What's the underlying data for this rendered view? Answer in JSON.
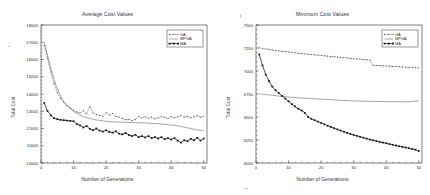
{
  "figure": {
    "background_color": "#ffffff",
    "axis_color": "#000000",
    "text_color": "#2b2b2b"
  },
  "chart_data": [
    {
      "type": "line",
      "title": "Average Cost Values",
      "xlabel": "Number of Generations",
      "ylabel": "Total Cost",
      "xlim": [
        0,
        51
      ],
      "ylim": [
        10000,
        18000
      ],
      "xticks": [
        0,
        10,
        20,
        30,
        40,
        50
      ],
      "yticks": [
        10000,
        11000,
        12000,
        13000,
        14000,
        15000,
        16000,
        17000,
        18000
      ],
      "xtick_labels": [
        "0",
        "10",
        "20",
        "30",
        "40",
        "50"
      ],
      "ytick_labels": [
        "10000",
        "11000",
        "12000",
        "13000",
        "14000",
        "15000",
        "16000",
        "17000",
        "18000"
      ],
      "grid": false,
      "legend_position": "upper right",
      "x": [
        1,
        2,
        3,
        4,
        5,
        6,
        7,
        8,
        9,
        10,
        11,
        12,
        13,
        14,
        15,
        16,
        17,
        18,
        19,
        20,
        21,
        22,
        23,
        24,
        25,
        26,
        27,
        28,
        29,
        30,
        31,
        32,
        33,
        34,
        35,
        36,
        37,
        38,
        39,
        40,
        41,
        42,
        43,
        44,
        45,
        46,
        47,
        48,
        49,
        50
      ],
      "series": [
        {
          "name": "GA",
          "style": "dashed-marker",
          "color": "#2a2a2a",
          "values": [
            16820,
            16080,
            15280,
            14620,
            14060,
            13760,
            13520,
            13320,
            13200,
            13060,
            12960,
            12900,
            13020,
            12840,
            13280,
            12900,
            12800,
            12760,
            12700,
            12940,
            12780,
            12860,
            12700,
            12660,
            12580,
            12500,
            12540,
            12460,
            12520,
            12700,
            12620,
            12680,
            12600,
            12660,
            12560,
            12620,
            12700,
            12640,
            12580,
            12700,
            12620,
            12680,
            12740,
            12660,
            12700,
            12620,
            12680,
            12740,
            12660,
            12700
          ]
        },
        {
          "name": "MPGA",
          "style": "solid-thin",
          "color": "#5a5a5a",
          "values": [
            17000,
            16250,
            15500,
            14850,
            14300,
            13900,
            13560,
            13320,
            13160,
            13000,
            12880,
            12780,
            12700,
            12640,
            12580,
            12540,
            12500,
            12470,
            12440,
            12420,
            12400,
            12390,
            12380,
            12370,
            12360,
            12350,
            12345,
            12340,
            12335,
            12330,
            12325,
            12320,
            12310,
            12300,
            12290,
            12280,
            12260,
            12240,
            12220,
            12200,
            12180,
            12150,
            12120,
            12080,
            12040,
            12000,
            11960,
            11920,
            11890,
            11870
          ]
        },
        {
          "name": "MA",
          "style": "thick-dotted",
          "color": "#111111",
          "values": [
            13480,
            13020,
            12760,
            12600,
            12540,
            12500,
            12480,
            12460,
            12440,
            12420,
            12260,
            12180,
            12060,
            12140,
            11980,
            11900,
            12000,
            11880,
            11820,
            11900,
            11800,
            11760,
            11840,
            11700,
            11660,
            11740,
            11620,
            11560,
            11640,
            11500,
            11560,
            11480,
            11560,
            11440,
            11500,
            11420,
            11500,
            11380,
            11440,
            11360,
            11440,
            11300,
            11180,
            11320,
            11260,
            11400,
            11320,
            11460,
            11300,
            11420
          ]
        }
      ],
      "legend": [
        {
          "label": "GA",
          "style": "dashed-marker"
        },
        {
          "label": "MPGA",
          "style": "solid-thin"
        },
        {
          "label": "MA",
          "style": "thick-dotted"
        }
      ]
    },
    {
      "type": "line",
      "title": "Minimum Cost Values",
      "xlabel": "Number of Generations",
      "ylabel": "Total Cost",
      "xlim": [
        0,
        51
      ],
      "ylim": [
        6000,
        7500
      ],
      "xticks": [
        0,
        10,
        20,
        30,
        40,
        50
      ],
      "yticks": [
        6000,
        6250,
        6500,
        6750,
        7000,
        7250,
        7500
      ],
      "xtick_labels": [
        "0",
        "10",
        "20",
        "30",
        "40",
        "50"
      ],
      "ytick_labels": [
        "6000",
        "6250",
        "6500",
        "6750",
        "7000",
        "7250",
        "7500"
      ],
      "grid": false,
      "legend_position": "upper right",
      "x": [
        1,
        2,
        3,
        4,
        5,
        6,
        7,
        8,
        9,
        10,
        11,
        12,
        13,
        14,
        15,
        16,
        17,
        18,
        19,
        20,
        21,
        22,
        23,
        24,
        25,
        26,
        27,
        28,
        29,
        30,
        31,
        32,
        33,
        34,
        35,
        36,
        37,
        38,
        39,
        40,
        41,
        42,
        43,
        44,
        45,
        46,
        47,
        48,
        49,
        50
      ],
      "series": [
        {
          "name": "GA",
          "style": "dashed-marker",
          "color": "#2a2a2a",
          "values": [
            7252,
            7246,
            7240,
            7234,
            7228,
            7222,
            7218,
            7214,
            7210,
            7206,
            7202,
            7198,
            7194,
            7190,
            7186,
            7182,
            7178,
            7176,
            7172,
            7168,
            7165,
            7162,
            7158,
            7155,
            7152,
            7148,
            7145,
            7142,
            7138,
            7135,
            7132,
            7128,
            7125,
            7122,
            7118,
            7062,
            7060,
            7058,
            7056,
            7054,
            7052,
            7050,
            7048,
            7046,
            7044,
            7042,
            7040,
            7038,
            7036,
            7034
          ]
        },
        {
          "name": "MPGA",
          "style": "solid-thin",
          "color": "#5a5a5a",
          "values": [
            6752,
            6748,
            6744,
            6740,
            6736,
            6732,
            6728,
            6724,
            6720,
            6717,
            6714,
            6711,
            6708,
            6706,
            6704,
            6702,
            6700,
            6698,
            6696,
            6694,
            6692,
            6690,
            6688,
            6686,
            6684,
            6682,
            6680,
            6678,
            6676,
            6675,
            6674,
            6673,
            6672,
            6671,
            6670,
            6669,
            6669,
            6668,
            6668,
            6667,
            6667,
            6666,
            6666,
            6666,
            6665,
            6665,
            6665,
            6670,
            6672,
            6674
          ]
        },
        {
          "name": "MA",
          "style": "thick-dotted",
          "color": "#111111",
          "values": [
            7180,
            7060,
            6960,
            6890,
            6830,
            6790,
            6760,
            6730,
            6700,
            6670,
            6640,
            6615,
            6590,
            6570,
            6545,
            6500,
            6480,
            6465,
            6450,
            6435,
            6420,
            6405,
            6392,
            6378,
            6365,
            6352,
            6340,
            6328,
            6316,
            6305,
            6295,
            6285,
            6275,
            6265,
            6255,
            6246,
            6238,
            6230,
            6222,
            6214,
            6206,
            6198,
            6190,
            6182,
            6175,
            6168,
            6160,
            6152,
            6145,
            6130
          ]
        }
      ],
      "legend": [
        {
          "label": "GA",
          "style": "dashed-marker"
        },
        {
          "label": "MPGA",
          "style": "solid-thin"
        },
        {
          "label": "MA",
          "style": "thick-dotted"
        }
      ]
    }
  ]
}
